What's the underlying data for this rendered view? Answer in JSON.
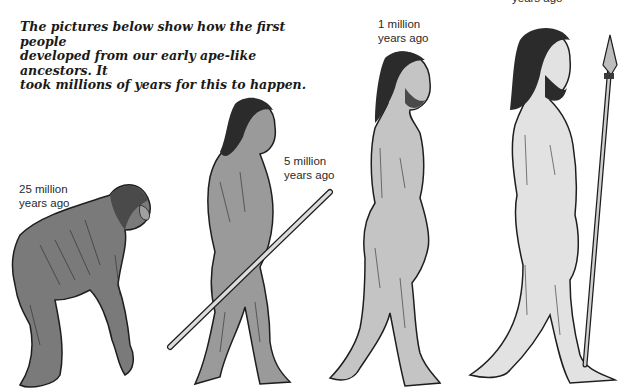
{
  "intro": {
    "line1": "The pictures below show how the first people",
    "line2": "developed from our early ape-like ancestors. It",
    "line3": "took millions of years for this to happen."
  },
  "stages": [
    {
      "figure": "ape-ancestor",
      "label_line1": "25 million",
      "label_line2": "years ago"
    },
    {
      "figure": "early-hominid-with-stick",
      "label_line1": "5 million",
      "label_line2": "years ago"
    },
    {
      "figure": "upright-hominid",
      "label_line1": "1 million",
      "label_line2": "years ago"
    },
    {
      "figure": "modern-human-with-spear",
      "label_line1": "",
      "label_line2": "years ago"
    }
  ],
  "colors": {
    "ape_fill": "#7a7a7a",
    "hominid_fill": "#9a9a9a",
    "upright_fill": "#c4c4c4",
    "human_fill": "#e2e2e2",
    "outline": "#1e1e1e",
    "hair": "#2b2b2b"
  }
}
